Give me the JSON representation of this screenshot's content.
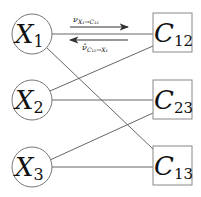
{
  "diagram": {
    "type": "factor-graph",
    "variable_nodes": [
      {
        "id": "X1",
        "label": "X",
        "subscript": "1"
      },
      {
        "id": "X2",
        "label": "X",
        "subscript": "2"
      },
      {
        "id": "X3",
        "label": "X",
        "subscript": "3"
      }
    ],
    "factor_nodes": [
      {
        "id": "C12",
        "label": "C",
        "subscript": "12"
      },
      {
        "id": "C23",
        "label": "C",
        "subscript": "23"
      },
      {
        "id": "C13",
        "label": "C",
        "subscript": "13"
      }
    ],
    "edges": [
      {
        "from": "X1",
        "to": "C12"
      },
      {
        "from": "X1",
        "to": "C13"
      },
      {
        "from": "X2",
        "to": "C12"
      },
      {
        "from": "X2",
        "to": "C23"
      },
      {
        "from": "X3",
        "to": "C23"
      },
      {
        "from": "X3",
        "to": "C13"
      }
    ],
    "messages": [
      {
        "label": "ν",
        "subscript": "X₁→C₁₂",
        "direction": "right"
      },
      {
        "label": "ν̂",
        "subscript": "C₁₂→X₁",
        "direction": "left"
      }
    ]
  },
  "colors": {
    "stroke": "#666666",
    "text": "#111111",
    "arrow": "#333333"
  }
}
